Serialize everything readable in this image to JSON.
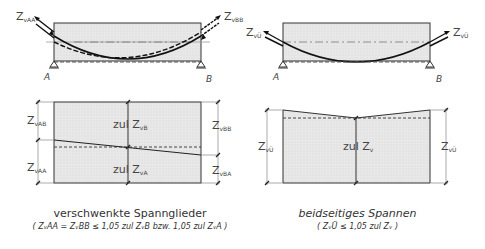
{
  "left": {
    "top_labels": {
      "z_left": "Z",
      "z_left_sub": "vAA",
      "z_right": "Z",
      "z_right_sub": "vBB",
      "support_a": "A",
      "support_b": "B"
    },
    "bottom_labels": {
      "z_vAB": "Z",
      "z_vAB_sub": "vAB",
      "z_vAA": "Z",
      "z_vAA_sub": "vAA",
      "z_vBB": "Z",
      "z_vBB_sub": "vBB",
      "z_vBA": "Z",
      "z_vBA_sub": "vBA",
      "zul_top": "zul Z",
      "zul_top_sub": "vB",
      "zul_bottom": "zul Z",
      "zul_bottom_sub": "vA"
    },
    "caption_title": "verschwenkte Spannglieder",
    "caption_sub": "( ZᵥAA = ZᵥBB ≤ 1,05 zul ZᵥB bzw. 1,05 zul ZᵥA )"
  },
  "right": {
    "top_labels": {
      "z_left": "Z",
      "z_left_sub": "vÜ",
      "z_right": "Z",
      "z_right_sub": "vÜ",
      "support_a": "A",
      "support_b": "B"
    },
    "bottom_labels": {
      "z_left": "Z",
      "z_left_sub": "vÜ",
      "z_right": "Z",
      "z_right_sub": "vÜ",
      "zul": "zul Z",
      "zul_sub": "v"
    },
    "caption_title": "beidseitiges Spannen",
    "caption_sub": "( ZᵥÜ ≤ 1,05 zul Zᵥ )"
  },
  "colors": {
    "fill": "#e6e6e6",
    "line": "#222222",
    "dim": "#888888"
  }
}
